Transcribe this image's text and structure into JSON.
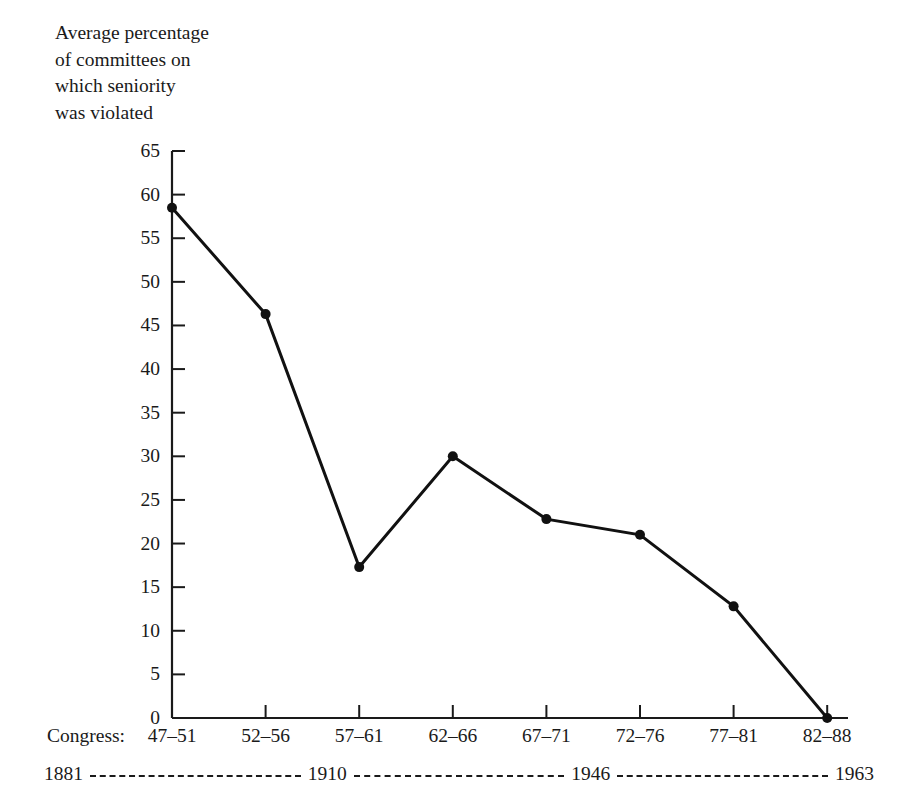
{
  "chart_data": {
    "type": "line",
    "title": "Average percentage\nof committees on\nwhich seniority\nwas violated",
    "xlabel": "Congress:",
    "ylabel": "",
    "categories": [
      "47–51",
      "52–56",
      "57–61",
      "62–66",
      "67–71",
      "72–76",
      "77–81",
      "82–88"
    ],
    "values": [
      58.5,
      46.3,
      17.3,
      30.0,
      22.8,
      21.0,
      12.8,
      0.0
    ],
    "ylim": [
      0,
      65
    ],
    "yticks": [
      0,
      5,
      10,
      15,
      20,
      25,
      30,
      35,
      40,
      45,
      50,
      55,
      60,
      65
    ],
    "ytick_labels": [
      "0",
      "5",
      "10",
      "15",
      "20",
      "25",
      "30",
      "35",
      "40",
      "45",
      "50",
      "55",
      "60",
      "65"
    ],
    "grid": false,
    "legend": false,
    "marker": "filled-circle",
    "line_color": "#111111",
    "line_width": 3,
    "marker_size": 5,
    "annotations": {
      "era_timeline": [
        "1881",
        "1910",
        "1946",
        "1963"
      ]
    }
  }
}
